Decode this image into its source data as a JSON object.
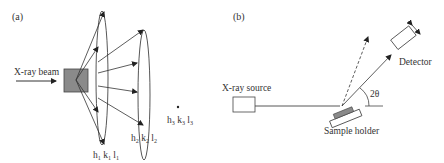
{
  "panel_a": {
    "label": "(a)",
    "beam_label": "X-ray beam",
    "cone1": {
      "h": "h",
      "h_sub": "1",
      "k": "k",
      "k_sub": "1",
      "l": "l",
      "l_sub": "1"
    },
    "cone2": {
      "h": "h",
      "h_sub": "2",
      "k": "k",
      "k_sub": "2",
      "l": "l",
      "l_sub": "2"
    },
    "cone3": {
      "h": "h",
      "h_sub": "3",
      "k": "k",
      "k_sub": "3",
      "l": "l",
      "l_sub": "3"
    }
  },
  "panel_b": {
    "label": "(b)",
    "source_label": "X-ray source",
    "detector_label": "Detector",
    "sample_label": "Sample holder",
    "angle_label": "2θ"
  },
  "colors": {
    "line": "#333333",
    "sample_fill": "#8a8a8a"
  }
}
